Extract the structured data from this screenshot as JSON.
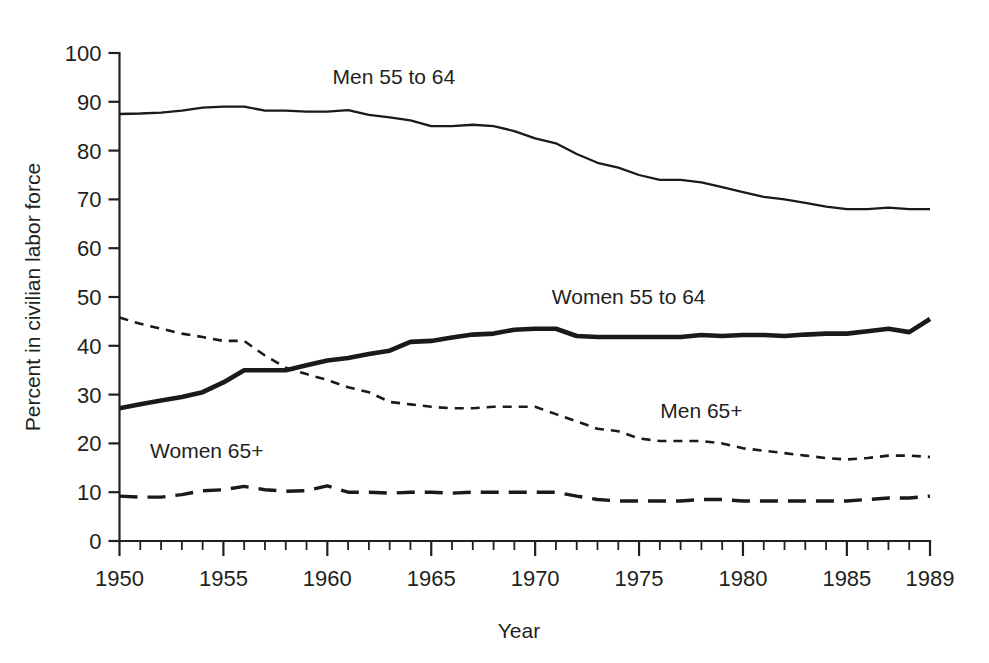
{
  "chart_data": {
    "type": "line",
    "title": "",
    "xlabel": "Year",
    "ylabel": "Percent in civilian labor force",
    "xlim": [
      1950,
      1989
    ],
    "ylim": [
      0,
      100
    ],
    "grid": false,
    "legend_position": "inline-annotations",
    "x_tick_labels": [
      "1950",
      "1955",
      "1960",
      "1965",
      "1970",
      "1975",
      "1980",
      "1985",
      "1989"
    ],
    "x_tick_values": [
      1950,
      1955,
      1960,
      1965,
      1970,
      1975,
      1980,
      1985,
      1989
    ],
    "x_minor_step": 1,
    "y_tick_labels": [
      "0",
      "10",
      "20",
      "30",
      "40",
      "50",
      "60",
      "70",
      "80",
      "90",
      "100"
    ],
    "y_tick_values": [
      0,
      10,
      20,
      30,
      40,
      50,
      60,
      70,
      80,
      90,
      100
    ],
    "x": [
      1950,
      1951,
      1952,
      1953,
      1954,
      1955,
      1956,
      1957,
      1958,
      1959,
      1960,
      1961,
      1962,
      1963,
      1964,
      1965,
      1966,
      1967,
      1968,
      1969,
      1970,
      1971,
      1972,
      1973,
      1974,
      1975,
      1976,
      1977,
      1978,
      1979,
      1980,
      1981,
      1982,
      1983,
      1984,
      1985,
      1986,
      1987,
      1988,
      1989
    ],
    "series": [
      {
        "name": "Men 55 to 64",
        "style": "solid-thin",
        "color": "#1a1a1a",
        "label": "Men 55 to 64",
        "label_x": 1963.2,
        "label_y": 93.6,
        "values": [
          87.5,
          87.6,
          87.8,
          88.2,
          88.8,
          89.0,
          89.0,
          88.2,
          88.2,
          88.0,
          88.0,
          88.3,
          87.3,
          86.8,
          86.2,
          85.0,
          85.0,
          85.3,
          85.0,
          84.0,
          82.5,
          81.5,
          79.3,
          77.5,
          76.5,
          75.0,
          74.0,
          74.0,
          73.5,
          72.5,
          71.5,
          70.5,
          70.0,
          69.3,
          68.5,
          68.0,
          68.0,
          68.3,
          68.0,
          68.0
        ]
      },
      {
        "name": "Women 55 to 64",
        "style": "solid-thick",
        "color": "#1a1a1a",
        "label": "Women 55 to 64",
        "label_x": 1974.5,
        "label_y": 48.6,
        "values": [
          27.2,
          28.0,
          28.8,
          29.5,
          30.5,
          32.5,
          35.0,
          35.0,
          35.0,
          36.0,
          37.0,
          37.5,
          38.3,
          39.0,
          40.8,
          41.0,
          41.7,
          42.3,
          42.5,
          43.3,
          43.5,
          43.5,
          42.0,
          41.8,
          41.8,
          41.8,
          41.8,
          41.8,
          42.2,
          42.0,
          42.2,
          42.2,
          42.0,
          42.3,
          42.5,
          42.5,
          43.0,
          43.5,
          42.8,
          45.5
        ]
      },
      {
        "name": "Men 65+",
        "style": "dashed-short",
        "color": "#1a1a1a",
        "label": "Men 65+",
        "label_x": 1978.0,
        "label_y": 25.3,
        "values": [
          45.8,
          44.5,
          43.5,
          42.5,
          41.8,
          41.0,
          41.0,
          38.0,
          35.5,
          34.2,
          33.0,
          31.5,
          30.5,
          28.5,
          28.0,
          27.5,
          27.2,
          27.2,
          27.5,
          27.5,
          27.5,
          26.0,
          24.5,
          23.0,
          22.5,
          21.0,
          20.5,
          20.5,
          20.5,
          20.0,
          19.0,
          18.5,
          18.0,
          17.5,
          17.0,
          16.7,
          17.0,
          17.5,
          17.5,
          17.2
        ]
      },
      {
        "name": "Women 65+",
        "style": "dashed-long",
        "color": "#1a1a1a",
        "label": "Women 65+",
        "label_x": 1954.2,
        "label_y": 17.0,
        "values": [
          9.2,
          9.0,
          9.0,
          9.5,
          10.3,
          10.5,
          11.2,
          10.5,
          10.2,
          10.3,
          11.3,
          10.0,
          10.0,
          9.8,
          10.0,
          10.0,
          9.8,
          10.0,
          10.0,
          10.0,
          10.0,
          10.0,
          9.2,
          8.5,
          8.2,
          8.2,
          8.2,
          8.2,
          8.5,
          8.5,
          8.2,
          8.2,
          8.2,
          8.2,
          8.2,
          8.2,
          8.5,
          8.8,
          8.8,
          9.2
        ]
      }
    ]
  },
  "axis": {
    "x_title": "Year",
    "y_title": "Percent in civilian labor force"
  }
}
